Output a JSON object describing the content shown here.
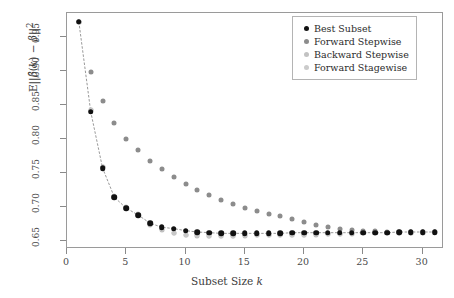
{
  "chart_data": {
    "type": "scatter",
    "title": "",
    "xlabel": "Subset Size k",
    "ylabel": "E||B(k) - B||^2",
    "xlim": [
      0,
      31.8
    ],
    "ylim": [
      0.638,
      0.985
    ],
    "xticks": [
      0,
      5,
      10,
      15,
      20,
      25,
      30
    ],
    "yticks": [
      0.65,
      0.7,
      0.75,
      0.8,
      0.85,
      0.9,
      0.95
    ],
    "grid": false,
    "legend_position": "top-right",
    "x": [
      1,
      2,
      3,
      4,
      5,
      6,
      7,
      8,
      9,
      10,
      11,
      12,
      13,
      14,
      15,
      16,
      17,
      18,
      19,
      20,
      21,
      22,
      23,
      24,
      25,
      26,
      27,
      28,
      29,
      30,
      31
    ],
    "series": [
      {
        "name": "Best Subset",
        "color": "#111111",
        "size": 5.6,
        "values": [
          0.972,
          0.84,
          0.757,
          0.714,
          0.698,
          0.688,
          0.676,
          0.67,
          0.668,
          0.665,
          0.663,
          0.662,
          0.661,
          0.661,
          0.661,
          0.661,
          0.661,
          0.661,
          0.662,
          0.662,
          0.662,
          0.662,
          0.662,
          0.662,
          0.662,
          0.662,
          0.662,
          0.663,
          0.663,
          0.663,
          0.663
        ]
      },
      {
        "name": "Forward Stepwise",
        "color": "#8c8c8c",
        "size": 5.0,
        "values": [
          0.972,
          0.898,
          0.856,
          0.823,
          0.8,
          0.783,
          0.768,
          0.755,
          0.744,
          0.734,
          0.725,
          0.717,
          0.71,
          0.704,
          0.699,
          0.694,
          0.69,
          0.686,
          0.682,
          0.678,
          0.674,
          0.671,
          0.668,
          0.666,
          0.665,
          0.664,
          0.663,
          0.663,
          0.663,
          0.663,
          0.663
        ]
      },
      {
        "name": "Backward Stepwise",
        "color": "#bdbdbd",
        "size": 5.0,
        "values": [
          0.972,
          0.843,
          0.759,
          0.715,
          0.699,
          0.688,
          0.674,
          0.666,
          0.661,
          0.658,
          0.657,
          0.657,
          0.657,
          0.657,
          0.657,
          0.658,
          0.658,
          0.658,
          0.659,
          0.659,
          0.659,
          0.66,
          0.66,
          0.66,
          0.661,
          0.661,
          0.661,
          0.662,
          0.662,
          0.662,
          0.663
        ]
      },
      {
        "name": "Forward Stagewise",
        "color": "#c8c8c8",
        "size": 5.0,
        "values": [
          0.972,
          0.842,
          0.758,
          0.716,
          0.7,
          0.689,
          0.675,
          0.667,
          0.662,
          0.659,
          0.658,
          0.657,
          0.657,
          0.657,
          0.658,
          0.658,
          0.658,
          0.659,
          0.659,
          0.659,
          0.66,
          0.66,
          0.66,
          0.661,
          0.661,
          0.661,
          0.662,
          0.662,
          0.662,
          0.663,
          0.663
        ]
      }
    ],
    "connector_line": {
      "label": "best-subset-trend-line",
      "color": "#6b6b6b"
    }
  },
  "axes": {
    "x_tick_labels": [
      "0",
      "5",
      "10",
      "15",
      "20",
      "25",
      "30"
    ],
    "y_tick_labels": [
      "0.65",
      "0.70",
      "0.75",
      "0.80",
      "0.85",
      "0.90",
      "0.95"
    ],
    "x_title_prefix": "Subset Size ",
    "x_title_symbol": "k",
    "y_title_parts": {
      "prefix": "E||",
      "beta_hat": "β̂",
      "k_open": "(",
      "k_sym": "k",
      "k_close": ")",
      "minus": " − ",
      "beta": "β",
      "suffix": "||",
      "power": "2"
    }
  },
  "legend": {
    "items": [
      {
        "label": "Best Subset",
        "color": "#111111"
      },
      {
        "label": "Forward Stepwise",
        "color": "#8c8c8c"
      },
      {
        "label": "Backward Stepwise",
        "color": "#c2c2c2"
      },
      {
        "label": "Forward Stagewise",
        "color": "#cbcbcb"
      }
    ]
  }
}
